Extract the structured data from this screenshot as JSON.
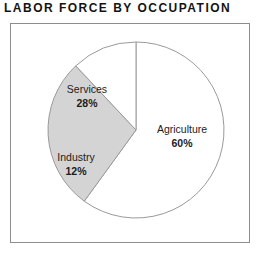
{
  "chart_data": {
    "type": "pie",
    "title": "LABOR FORCE BY OCCUPATION",
    "xlabel": "",
    "ylabel": "",
    "legend_position": "none",
    "grid": false,
    "start_angle_deg": 0,
    "direction": "clockwise",
    "unit": "%",
    "categories": [
      "Agriculture",
      "Services",
      "Industry"
    ],
    "values": [
      60,
      28,
      12
    ],
    "slices": [
      {
        "name": "Agriculture",
        "label": "Agriculture",
        "value": 60,
        "value_text": "60%",
        "color": "#ffffff",
        "edge_color": "#9a9a9a"
      },
      {
        "name": "Services",
        "label": "Services",
        "value": 28,
        "value_text": "28%",
        "color": "#d4d4d4",
        "edge_color": "#9a9a9a"
      },
      {
        "name": "Industry",
        "label": "Industry",
        "value": 12,
        "value_text": "12%",
        "color": "#ffffff",
        "edge_color": "#9a9a9a"
      }
    ]
  },
  "figure": {
    "title": "LABOR FORCE BY OCCUPATION",
    "background_color": "#ffffff",
    "frame_color": "#8d8d8d",
    "text_color": "#131313"
  }
}
